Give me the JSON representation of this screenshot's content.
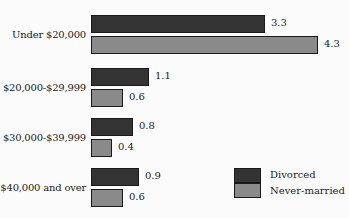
{
  "chart_data": {
    "type": "bar",
    "orientation": "horizontal",
    "title": "",
    "xlabel": "",
    "ylabel": "",
    "categories": [
      "Under $20,000",
      "$20,000-$29,999",
      "$30,000-$39,999",
      "$40,000 and over"
    ],
    "series": [
      {
        "name": "Divorced",
        "color": "#333333",
        "values": [
          3.3,
          1.1,
          0.8,
          0.9
        ],
        "labels": [
          "3.3",
          "1.1",
          "0.8",
          "0.9"
        ]
      },
      {
        "name": "Never-married",
        "color": "#8a8a8a",
        "values": [
          4.3,
          0.6,
          0.4,
          0.6
        ],
        "labels": [
          "4.3",
          "0.6",
          "0.4",
          "0.6"
        ]
      }
    ],
    "grid": false,
    "axes_visible": false,
    "data_labels": true,
    "legend_position": "bottom-right"
  },
  "legend": {
    "items": [
      {
        "label": "Divorced",
        "color": "#333333"
      },
      {
        "label": "Never-married",
        "color": "#8a8a8a"
      }
    ]
  }
}
